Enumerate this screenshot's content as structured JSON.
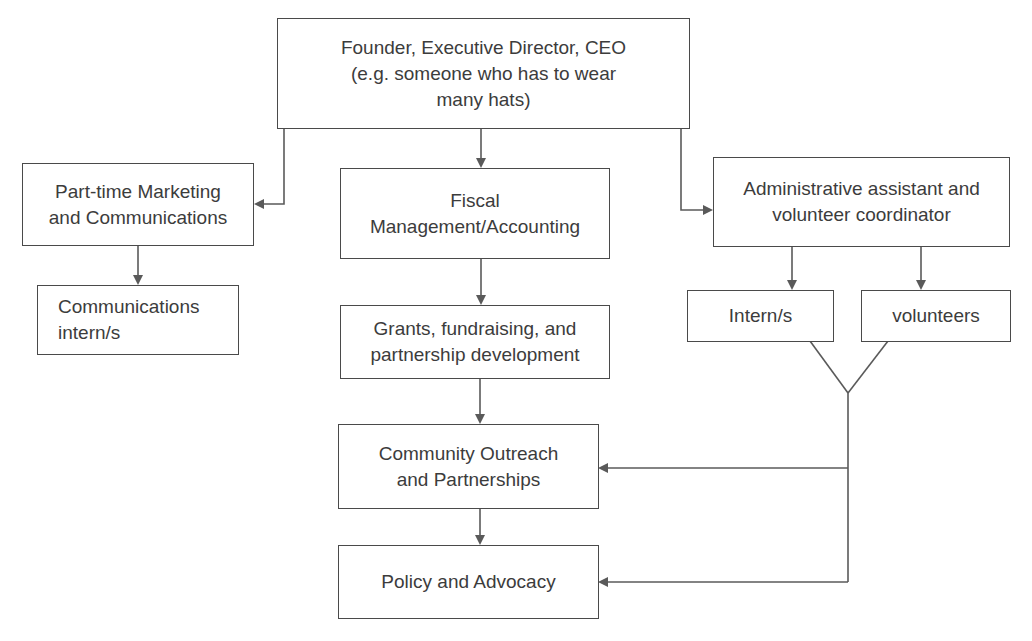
{
  "diagram": {
    "type": "org-chart",
    "line_color": "#5a5a5a",
    "box_border_color": "#4a4a4a",
    "nodes": {
      "ceo": {
        "label": "Founder, Executive Director, CEO\n(e.g. someone who has to wear\nmany hats)"
      },
      "marketing": {
        "label": "Part-time Marketing\nand Communications"
      },
      "comms_interns": {
        "label": "Communications\nintern/s"
      },
      "fiscal": {
        "label": "Fiscal\nManagement/Accounting"
      },
      "grants": {
        "label": "Grants, fundraising, and\npartnership development"
      },
      "community": {
        "label": "Community Outreach\nand Partnerships"
      },
      "policy": {
        "label": "Policy and Advocacy"
      },
      "admin": {
        "label": "Administrative assistant and\nvolunteer coordinator"
      },
      "interns": {
        "label": "Intern/s"
      },
      "volunteers": {
        "label": "volunteers"
      }
    },
    "edges": [
      {
        "from": "ceo",
        "to": "marketing"
      },
      {
        "from": "ceo",
        "to": "fiscal"
      },
      {
        "from": "ceo",
        "to": "admin"
      },
      {
        "from": "marketing",
        "to": "comms_interns"
      },
      {
        "from": "fiscal",
        "to": "grants"
      },
      {
        "from": "grants",
        "to": "community"
      },
      {
        "from": "community",
        "to": "policy"
      },
      {
        "from": "admin",
        "to": "interns"
      },
      {
        "from": "admin",
        "to": "volunteers"
      },
      {
        "from": [
          "interns",
          "volunteers"
        ],
        "to": "community"
      },
      {
        "from": [
          "interns",
          "volunteers"
        ],
        "to": "policy"
      }
    ]
  }
}
